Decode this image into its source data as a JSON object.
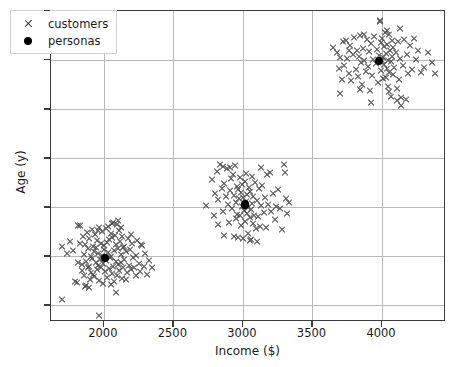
{
  "chart_data": {
    "type": "scatter",
    "title": "",
    "xlabel": "Income ($)",
    "ylabel": "Age (y)",
    "xlim": [
      1620,
      4460
    ],
    "ylim": [
      13.3,
      45.0
    ],
    "xticks": [
      2000,
      2500,
      3000,
      3500,
      4000
    ],
    "yticks": [
      15,
      20,
      25,
      30,
      35,
      40,
      45
    ],
    "xticklabels": [
      "2000",
      "2500",
      "3000",
      "3500",
      "4000"
    ],
    "yticklabels": [
      "15",
      "20",
      "25",
      "30",
      "35",
      "40",
      "45"
    ],
    "grid": true,
    "legend": {
      "position": "upper left",
      "entries": [
        {
          "label": "customers",
          "marker": "x",
          "color": "#4a4a4a"
        },
        {
          "label": "personas",
          "marker": "o",
          "color": "#000000"
        }
      ]
    },
    "series": [
      {
        "name": "customers",
        "marker": "x",
        "color": "#4a4a4a",
        "points": [
          [
            1699,
            15.6
          ],
          [
            1963,
            14.0
          ],
          [
            1700,
            21.0
          ],
          [
            1737,
            20.3
          ],
          [
            1756,
            21.5
          ],
          [
            1780,
            20.6
          ],
          [
            1806,
            17.3
          ],
          [
            1812,
            23.1
          ],
          [
            1830,
            23.1
          ],
          [
            1843,
            19.2
          ],
          [
            1846,
            18.5
          ],
          [
            1852,
            22.0
          ],
          [
            1858,
            20.2
          ],
          [
            1861,
            18.0
          ],
          [
            1866,
            21.2
          ],
          [
            1872,
            19.5
          ],
          [
            1875,
            17.0
          ],
          [
            1879,
            22.4
          ],
          [
            1884,
            18.8
          ],
          [
            1889,
            20.8
          ],
          [
            1893,
            19.0
          ],
          [
            1897,
            21.8
          ],
          [
            1901,
            17.6
          ],
          [
            1905,
            20.0
          ],
          [
            1909,
            18.3
          ],
          [
            1913,
            22.7
          ],
          [
            1917,
            19.8
          ],
          [
            1921,
            21.0
          ],
          [
            1925,
            18.1
          ],
          [
            1929,
            20.5
          ],
          [
            1933,
            17.9
          ],
          [
            1937,
            22.2
          ],
          [
            1941,
            19.4
          ],
          [
            1945,
            20.9
          ],
          [
            1949,
            18.6
          ],
          [
            1953,
            21.6
          ],
          [
            1957,
            19.1
          ],
          [
            1961,
            20.3
          ],
          [
            1965,
            17.5
          ],
          [
            1969,
            22.9
          ],
          [
            1973,
            19.7
          ],
          [
            1977,
            21.3
          ],
          [
            1981,
            18.9
          ],
          [
            1985,
            20.1
          ],
          [
            1989,
            22.5
          ],
          [
            1993,
            19.3
          ],
          [
            1997,
            17.2
          ],
          [
            2001,
            21.1
          ],
          [
            2005,
            20.7
          ],
          [
            2009,
            18.4
          ],
          [
            2013,
            22.8
          ],
          [
            2017,
            19.6
          ],
          [
            2021,
            21.4
          ],
          [
            2025,
            17.8
          ],
          [
            2029,
            20.4
          ],
          [
            2033,
            23.0
          ],
          [
            2037,
            18.7
          ],
          [
            2041,
            21.7
          ],
          [
            2045,
            19.9
          ],
          [
            2049,
            20.0
          ],
          [
            2053,
            22.3
          ],
          [
            2057,
            18.2
          ],
          [
            2061,
            21.9
          ],
          [
            2065,
            19.0
          ],
          [
            2069,
            23.4
          ],
          [
            2073,
            20.6
          ],
          [
            2077,
            17.4
          ],
          [
            2081,
            22.1
          ],
          [
            2085,
            19.5
          ],
          [
            2089,
            21.2
          ],
          [
            2093,
            18.0
          ],
          [
            2097,
            23.2
          ],
          [
            2101,
            20.8
          ],
          [
            2105,
            19.2
          ],
          [
            2109,
            22.6
          ],
          [
            2113,
            18.5
          ],
          [
            2117,
            21.5
          ],
          [
            2121,
            20.2
          ],
          [
            2125,
            19.4
          ],
          [
            2129,
            17.7
          ],
          [
            2133,
            22.0
          ],
          [
            2137,
            20.9
          ],
          [
            2141,
            18.8
          ],
          [
            2145,
            21.0
          ],
          [
            2149,
            19.7
          ],
          [
            2157,
            20.5
          ],
          [
            2165,
            18.3
          ],
          [
            2173,
            21.8
          ],
          [
            2181,
            19.1
          ],
          [
            2189,
            20.7
          ],
          [
            2197,
            18.6
          ],
          [
            2205,
            21.3
          ],
          [
            2213,
            19.9
          ],
          [
            2221,
            18.9
          ],
          [
            2229,
            20.1
          ],
          [
            2237,
            21.6
          ],
          [
            2250,
            19.3
          ],
          [
            2262,
            18.4
          ],
          [
            2275,
            21.1
          ],
          [
            2287,
            19.0
          ],
          [
            2300,
            20.3
          ],
          [
            2312,
            18.1
          ],
          [
            2325,
            19.6
          ],
          [
            2345,
            18.9
          ],
          [
            2090,
            16.3
          ],
          [
            1864,
            16.9
          ],
          [
            1892,
            16.8
          ],
          [
            2050,
            17.1
          ],
          [
            1792,
            17.4
          ],
          [
            2158,
            17.6
          ],
          [
            2230,
            18.0
          ],
          [
            2104,
            23.6
          ],
          [
            2060,
            23.3
          ],
          [
            1960,
            22.6
          ],
          [
            2126,
            22.9
          ],
          [
            1826,
            21.3
          ],
          [
            2268,
            21.2
          ],
          [
            1818,
            19.4
          ],
          [
            2196,
            22.2
          ],
          [
            2733,
            25.2
          ],
          [
            2776,
            27.8
          ],
          [
            2800,
            26.4
          ],
          [
            2812,
            28.6
          ],
          [
            2824,
            25.8
          ],
          [
            2836,
            29.3
          ],
          [
            2848,
            26.9
          ],
          [
            2860,
            24.6
          ],
          [
            2868,
            27.4
          ],
          [
            2876,
            26.1
          ],
          [
            2884,
            28.9
          ],
          [
            2892,
            25.3
          ],
          [
            2900,
            23.4
          ],
          [
            2908,
            26.7
          ],
          [
            2916,
            27.9
          ],
          [
            2924,
            24.9
          ],
          [
            2932,
            28.3
          ],
          [
            2936,
            22.0
          ],
          [
            2940,
            26.2
          ],
          [
            2948,
            25.5
          ],
          [
            2952,
            23.8
          ],
          [
            2956,
            27.1
          ],
          [
            2960,
            24.3
          ],
          [
            2964,
            26.8
          ],
          [
            2968,
            21.9
          ],
          [
            2972,
            25.9
          ],
          [
            2976,
            28.0
          ],
          [
            2980,
            24.1
          ],
          [
            2984,
            26.5
          ],
          [
            2988,
            23.1
          ],
          [
            2992,
            27.3
          ],
          [
            2996,
            25.1
          ],
          [
            3000,
            21.8
          ],
          [
            3004,
            26.0
          ],
          [
            3008,
            24.7
          ],
          [
            3012,
            27.6
          ],
          [
            3016,
            23.5
          ],
          [
            3020,
            25.6
          ],
          [
            3024,
            28.4
          ],
          [
            3028,
            24.4
          ],
          [
            3032,
            26.3
          ],
          [
            3036,
            22.3
          ],
          [
            3040,
            25.0
          ],
          [
            3044,
            27.0
          ],
          [
            3048,
            23.9
          ],
          [
            3052,
            26.6
          ],
          [
            3056,
            24.8
          ],
          [
            3060,
            21.7
          ],
          [
            3064,
            25.4
          ],
          [
            3068,
            28.1
          ],
          [
            3072,
            23.3
          ],
          [
            3076,
            26.1
          ],
          [
            3080,
            24.2
          ],
          [
            3084,
            27.5
          ],
          [
            3092,
            22.8
          ],
          [
            3100,
            25.7
          ],
          [
            3108,
            24.0
          ],
          [
            3116,
            26.9
          ],
          [
            3124,
            23.0
          ],
          [
            3132,
            25.2
          ],
          [
            3140,
            27.2
          ],
          [
            3150,
            24.5
          ],
          [
            3160,
            26.0
          ],
          [
            3170,
            22.9
          ],
          [
            3180,
            25.3
          ],
          [
            3192,
            28.5
          ],
          [
            3204,
            24.6
          ],
          [
            3216,
            26.4
          ],
          [
            3228,
            23.7
          ],
          [
            3240,
            25.1
          ],
          [
            3255,
            26.8
          ],
          [
            3270,
            24.9
          ],
          [
            3285,
            22.7
          ],
          [
            3296,
            29.3
          ],
          [
            3300,
            28.5
          ],
          [
            3310,
            25.9
          ],
          [
            3320,
            24.4
          ],
          [
            3335,
            25.5
          ],
          [
            2944,
            29.2
          ],
          [
            2908,
            29.0
          ],
          [
            2860,
            29.1
          ],
          [
            3128,
            29.0
          ],
          [
            3176,
            28.3
          ],
          [
            2792,
            24.2
          ],
          [
            2820,
            23.2
          ],
          [
            3052,
            21.6
          ],
          [
            3100,
            21.5
          ],
          [
            2864,
            22.1
          ],
          [
            3650,
            41.3
          ],
          [
            3680,
            40.8
          ],
          [
            3700,
            36.6
          ],
          [
            3710,
            38.0
          ],
          [
            3720,
            41.9
          ],
          [
            3730,
            39.4
          ],
          [
            3740,
            42.0
          ],
          [
            3750,
            40.2
          ],
          [
            3760,
            38.6
          ],
          [
            3770,
            41.5
          ],
          [
            3780,
            37.9
          ],
          [
            3790,
            40.6
          ],
          [
            3800,
            42.3
          ],
          [
            3810,
            39.0
          ],
          [
            3818,
            41.0
          ],
          [
            3826,
            38.3
          ],
          [
            3834,
            40.4
          ],
          [
            3842,
            42.5
          ],
          [
            3850,
            39.7
          ],
          [
            3858,
            37.5
          ],
          [
            3866,
            41.2
          ],
          [
            3874,
            40.0
          ],
          [
            3882,
            38.8
          ],
          [
            3890,
            42.1
          ],
          [
            3898,
            39.3
          ],
          [
            3906,
            40.9
          ],
          [
            3914,
            36.9
          ],
          [
            3922,
            41.7
          ],
          [
            3930,
            38.4
          ],
          [
            3938,
            40.1
          ],
          [
            3946,
            42.4
          ],
          [
            3954,
            39.6
          ],
          [
            3962,
            41.1
          ],
          [
            3970,
            37.7
          ],
          [
            3978,
            40.5
          ],
          [
            3986,
            43.9
          ],
          [
            3990,
            38.9
          ],
          [
            3994,
            41.8
          ],
          [
            3998,
            39.9
          ],
          [
            4002,
            42.2
          ],
          [
            4006,
            40.3
          ],
          [
            4010,
            38.1
          ],
          [
            4014,
            41.4
          ],
          [
            4018,
            39.5
          ],
          [
            4022,
            42.8
          ],
          [
            4026,
            40.7
          ],
          [
            4030,
            38.2
          ],
          [
            4034,
            41.6
          ],
          [
            4038,
            39.1
          ],
          [
            4042,
            37.3
          ],
          [
            4046,
            40.0
          ],
          [
            4050,
            42.6
          ],
          [
            4054,
            38.7
          ],
          [
            4058,
            41.0
          ],
          [
            4062,
            39.8
          ],
          [
            4066,
            36.3
          ],
          [
            4070,
            40.4
          ],
          [
            4074,
            42.0
          ],
          [
            4078,
            38.5
          ],
          [
            4082,
            41.3
          ],
          [
            4090,
            39.2
          ],
          [
            4098,
            40.8
          ],
          [
            4106,
            37.1
          ],
          [
            4114,
            41.9
          ],
          [
            4122,
            38.0
          ],
          [
            4130,
            40.2
          ],
          [
            4140,
            35.4
          ],
          [
            4150,
            39.4
          ],
          [
            4160,
            42.1
          ],
          [
            4170,
            36.0
          ],
          [
            4180,
            40.6
          ],
          [
            4190,
            38.6
          ],
          [
            4200,
            41.5
          ],
          [
            4215,
            39.0
          ],
          [
            4230,
            42.2
          ],
          [
            4245,
            40.1
          ],
          [
            4260,
            41.0
          ],
          [
            4280,
            38.7
          ],
          [
            4300,
            39.2
          ],
          [
            4330,
            40.8
          ],
          [
            4360,
            39.7
          ],
          [
            4380,
            38.6
          ],
          [
            3920,
            35.7
          ],
          [
            4050,
            36.8
          ],
          [
            4105,
            35.9
          ],
          [
            4140,
            36.2
          ],
          [
            3985,
            44.0
          ],
          [
            4040,
            43.0
          ],
          [
            3870,
            42.6
          ],
          [
            4130,
            43.2
          ],
          [
            3700,
            40.3
          ],
          [
            3688,
            39.1
          ],
          [
            3760,
            41.0
          ],
          [
            3844,
            37.0
          ]
        ]
      },
      {
        "name": "personas",
        "marker": "o",
        "color": "#000000",
        "points": [
          [
            2007,
            19.8
          ],
          [
            3015,
            25.3
          ],
          [
            3980,
            39.9
          ]
        ]
      }
    ]
  }
}
